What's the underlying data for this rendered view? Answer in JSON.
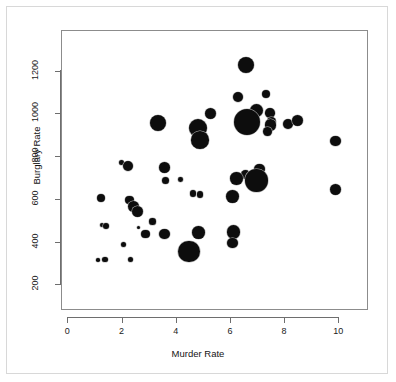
{
  "chart_data": {
    "type": "scatter",
    "title": "",
    "xlabel": "Murder Rate",
    "ylabel": "Burglary Rate",
    "xlim": [
      -0.25,
      11.1
    ],
    "ylim": [
      170,
      1300
    ],
    "xticks": [
      0,
      2,
      4,
      6,
      8,
      10
    ],
    "yticks": [
      200,
      400,
      600,
      800,
      1000,
      1200
    ],
    "grid": false,
    "legend": null,
    "marker": "filled-circle",
    "marker_color": "#0d0d0d",
    "size_encoding": "bubble-area",
    "points": [
      {
        "x": 6.55,
        "y": 1230,
        "size": 8.3
      },
      {
        "x": 6.25,
        "y": 1080,
        "size": 5.0
      },
      {
        "x": 7.3,
        "y": 1095,
        "size": 4.1
      },
      {
        "x": 6.95,
        "y": 1020,
        "size": 6.5
      },
      {
        "x": 7.45,
        "y": 1005,
        "size": 4.8
      },
      {
        "x": 5.25,
        "y": 1005,
        "size": 5.5
      },
      {
        "x": 7.5,
        "y": 965,
        "size": 4.6
      },
      {
        "x": 6.6,
        "y": 965,
        "size": 13.0
      },
      {
        "x": 3.3,
        "y": 960,
        "size": 8.0
      },
      {
        "x": 4.8,
        "y": 935,
        "size": 9.0
      },
      {
        "x": 7.45,
        "y": 950,
        "size": 5.6
      },
      {
        "x": 8.1,
        "y": 955,
        "size": 5.2
      },
      {
        "x": 8.45,
        "y": 970,
        "size": 5.6
      },
      {
        "x": 7.35,
        "y": 920,
        "size": 4.4
      },
      {
        "x": 4.85,
        "y": 880,
        "size": 8.8
      },
      {
        "x": 9.85,
        "y": 875,
        "size": 5.3
      },
      {
        "x": 1.95,
        "y": 775,
        "size": 2.6
      },
      {
        "x": 2.2,
        "y": 760,
        "size": 5.1
      },
      {
        "x": 3.55,
        "y": 750,
        "size": 5.3
      },
      {
        "x": 7.05,
        "y": 745,
        "size": 5.2
      },
      {
        "x": 6.55,
        "y": 720,
        "size": 4.6
      },
      {
        "x": 6.2,
        "y": 700,
        "size": 6.2
      },
      {
        "x": 6.95,
        "y": 690,
        "size": 11.2
      },
      {
        "x": 3.6,
        "y": 690,
        "size": 3.5
      },
      {
        "x": 4.15,
        "y": 695,
        "size": 2.4
      },
      {
        "x": 6.05,
        "y": 615,
        "size": 6.4
      },
      {
        "x": 4.6,
        "y": 630,
        "size": 3.4
      },
      {
        "x": 4.85,
        "y": 625,
        "size": 3.2
      },
      {
        "x": 1.2,
        "y": 608,
        "size": 4.1
      },
      {
        "x": 2.25,
        "y": 600,
        "size": 4.3
      },
      {
        "x": 9.85,
        "y": 648,
        "size": 5.4
      },
      {
        "x": 2.4,
        "y": 570,
        "size": 5.4
      },
      {
        "x": 2.55,
        "y": 545,
        "size": 5.6
      },
      {
        "x": 1.25,
        "y": 482,
        "size": 2.3
      },
      {
        "x": 1.4,
        "y": 476,
        "size": 3.1
      },
      {
        "x": 3.1,
        "y": 498,
        "size": 3.3
      },
      {
        "x": 2.6,
        "y": 472,
        "size": 1.7
      },
      {
        "x": 6.1,
        "y": 450,
        "size": 6.6
      },
      {
        "x": 4.8,
        "y": 448,
        "size": 6.3
      },
      {
        "x": 3.55,
        "y": 440,
        "size": 5.2
      },
      {
        "x": 2.85,
        "y": 440,
        "size": 4.4
      },
      {
        "x": 6.05,
        "y": 398,
        "size": 5.4
      },
      {
        "x": 2.05,
        "y": 390,
        "size": 2.6
      },
      {
        "x": 4.45,
        "y": 358,
        "size": 10.8
      },
      {
        "x": 1.1,
        "y": 318,
        "size": 1.8
      },
      {
        "x": 1.35,
        "y": 320,
        "size": 2.7
      },
      {
        "x": 2.3,
        "y": 322,
        "size": 2.8
      }
    ]
  },
  "axes": {
    "x_tick_labels": [
      "0",
      "2",
      "4",
      "6",
      "8",
      "10"
    ],
    "y_tick_labels": [
      "200",
      "400",
      "600",
      "800",
      "1000",
      "1200"
    ],
    "x_title": "Murder Rate",
    "y_title": "Burglary Rate"
  }
}
